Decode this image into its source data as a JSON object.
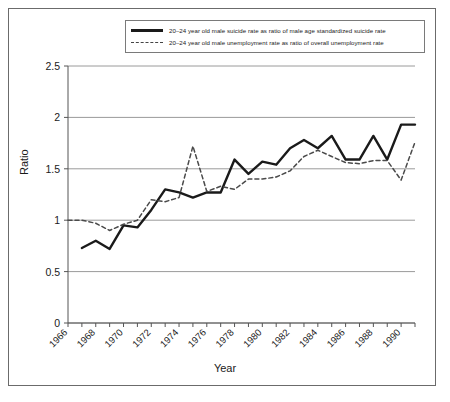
{
  "chart_data": {
    "type": "line",
    "title": "",
    "xlabel": "Year",
    "ylabel": "Ratio",
    "xlim": [
      1966,
      1991
    ],
    "ylim": [
      0,
      2.5
    ],
    "yticks": [
      "0",
      "0.5",
      "1",
      "1.5",
      "2",
      "2.5"
    ],
    "ytick_values": [
      0,
      0.5,
      1,
      1.5,
      2,
      2.5
    ],
    "xticks": [
      "1966",
      "1968",
      "1970",
      "1972",
      "1974",
      "1976",
      "1978",
      "1980",
      "1982",
      "1984",
      "1986",
      "1988",
      "1990"
    ],
    "xtick_values": [
      1966,
      1968,
      1970,
      1972,
      1974,
      1976,
      1978,
      1980,
      1982,
      1984,
      1986,
      1988,
      1990
    ],
    "grid": "horizontal",
    "legend_position": "top-center",
    "series": [
      {
        "name": "20–24 year old male suicide rate as ratio of male age standardized suicide rate",
        "style": "solid",
        "color": "#1a1a1a",
        "x": [
          1967,
          1968,
          1969,
          1970,
          1971,
          1972,
          1973,
          1974,
          1975,
          1976,
          1977,
          1978,
          1979,
          1980,
          1981,
          1982,
          1983,
          1984,
          1985,
          1986,
          1987,
          1988,
          1989,
          1990,
          1991
        ],
        "values": [
          0.73,
          0.8,
          0.72,
          0.95,
          0.93,
          1.1,
          1.3,
          1.27,
          1.22,
          1.27,
          1.27,
          1.59,
          1.45,
          1.57,
          1.54,
          1.7,
          1.78,
          1.7,
          1.82,
          1.59,
          1.59,
          1.82,
          1.59,
          1.93,
          1.93
        ]
      },
      {
        "name": "20–24 year old male unemployment rate as ratio of overall unemployment rate",
        "style": "dashed",
        "color": "#4a4a4a",
        "x": [
          1966,
          1967,
          1968,
          1969,
          1970,
          1971,
          1972,
          1973,
          1974,
          1975,
          1976,
          1977,
          1978,
          1979,
          1980,
          1981,
          1982,
          1983,
          1984,
          1985,
          1986,
          1987,
          1988,
          1989,
          1990,
          1991
        ],
        "values": [
          1.0,
          1.0,
          0.97,
          0.9,
          0.96,
          1.0,
          1.2,
          1.18,
          1.22,
          1.72,
          1.28,
          1.33,
          1.3,
          1.4,
          1.4,
          1.42,
          1.48,
          1.62,
          1.68,
          1.62,
          1.56,
          1.55,
          1.58,
          1.58,
          1.39,
          1.76
        ]
      }
    ]
  },
  "legend": {
    "items": [
      {
        "label": "20–24 year old male suicide rate as ratio of male age standardized suicide rate",
        "key": "solid-line-key"
      },
      {
        "label": "20–24 year old male unemployment rate as ratio of overall unemployment rate",
        "key": "dashed-line-key"
      }
    ]
  },
  "axes": {
    "y_title": "Ratio",
    "x_title": "Year"
  }
}
